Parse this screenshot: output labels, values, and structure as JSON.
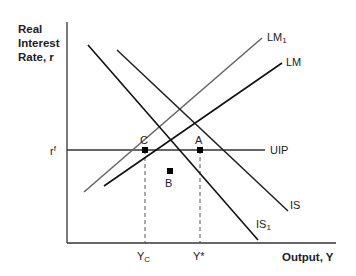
{
  "diagram": {
    "y_axis_label_lines": [
      "Real",
      "Interest",
      "Rate, r"
    ],
    "x_axis_label": "Output, Y",
    "y_tick_label": "r",
    "y_tick_sup": "f",
    "x_tick_labels": [
      {
        "base": "Y",
        "sub": "C"
      },
      {
        "base": "Y*",
        "sub": ""
      }
    ],
    "curves": [
      {
        "name": "LM1",
        "base": "LM",
        "sub": "1",
        "color": "#555555"
      },
      {
        "name": "LM",
        "base": "LM",
        "sub": "",
        "color": "#111111"
      },
      {
        "name": "UIP",
        "base": "UIP",
        "sub": "",
        "color": "#333333"
      },
      {
        "name": "IS",
        "base": "IS",
        "sub": "",
        "color": "#222222"
      },
      {
        "name": "IS1",
        "base": "IS",
        "sub": "1",
        "color": "#111111"
      }
    ],
    "points": [
      "A",
      "B",
      "C"
    ]
  }
}
